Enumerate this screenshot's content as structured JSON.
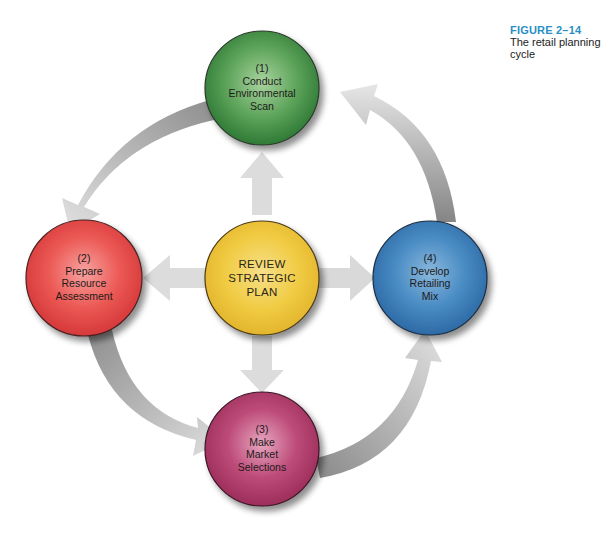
{
  "caption": {
    "figure_number": "FIGURE 2–14",
    "title_line1": "The retail planning",
    "title_line2": "cycle",
    "accent_color": "#2a8fc4"
  },
  "nodes": {
    "step1": {
      "number": "(1)",
      "line1": "Conduct",
      "line2": "Environmental",
      "line3": "Scan",
      "color": "#4e9a4e"
    },
    "step2": {
      "number": "(2)",
      "line1": "Prepare",
      "line2": "Resource",
      "line3": "Assessment",
      "color": "#e24b48"
    },
    "step3": {
      "number": "(3)",
      "line1": "Make",
      "line2": "Market",
      "line3": "Selections",
      "color": "#b23d6c"
    },
    "step4": {
      "number": "(4)",
      "line1": "Develop",
      "line2": "Retailing",
      "line3": "Mix",
      "color": "#3c7fba"
    },
    "center": {
      "line1": "REVIEW",
      "line2": "STRATEGIC",
      "line3": "PLAN",
      "color": "#f0c93e"
    }
  },
  "arrows": {
    "cycle": [
      "step1 → step2",
      "step2 → step3",
      "step3 → step4",
      "step4 → step1"
    ],
    "from_center": [
      "center → step1",
      "center → step2",
      "center → step3",
      "center → step4"
    ],
    "color": "#c8c8c8"
  }
}
